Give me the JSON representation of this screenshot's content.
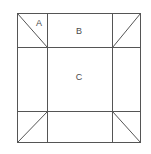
{
  "figure": {
    "title": "",
    "type": "geometric-diagram",
    "background_color": "#ffffff",
    "line_color": "#555555",
    "label_color": "#4a4a4a",
    "line_width": 1,
    "outer_square": {
      "x": 17,
      "y": 13,
      "width": 124,
      "height": 130
    },
    "grid": {
      "vertical_lines": [
        47,
        112
      ],
      "horizontal_lines": [
        47,
        111
      ]
    },
    "corner_diagonals": [
      {
        "name": "top-left",
        "x1": 17,
        "y1": 13,
        "x2": 47,
        "y2": 47
      },
      {
        "name": "top-right",
        "x1": 112,
        "y1": 47,
        "x2": 141,
        "y2": 13
      },
      {
        "name": "bottom-left",
        "x1": 17,
        "y1": 143,
        "x2": 47,
        "y2": 111
      },
      {
        "name": "bottom-right",
        "x1": 112,
        "y1": 111,
        "x2": 141,
        "y2": 143
      }
    ],
    "labels": [
      {
        "id": "a",
        "text": "A",
        "x": 39,
        "y": 24
      },
      {
        "id": "b",
        "text": "B",
        "x": 79,
        "y": 32
      },
      {
        "id": "c",
        "text": "C",
        "x": 79,
        "y": 78
      }
    ]
  }
}
